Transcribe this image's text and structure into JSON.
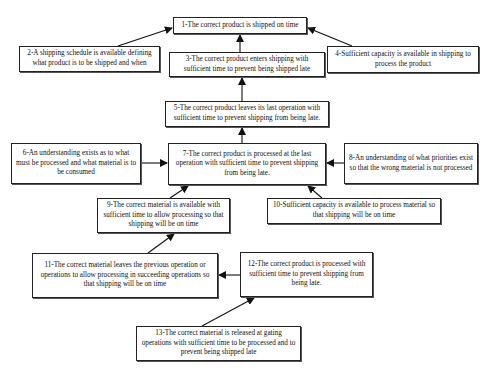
{
  "diagram": {
    "type": "prerequisite-tree",
    "nodes": [
      {
        "id": 1,
        "text": "1-The correct product is shipped on time",
        "box": [
          173,
          17,
          134,
          17
        ]
      },
      {
        "id": 2,
        "text": "2-A shipping schedule is available defining what product is to be shipped and when",
        "box": [
          19,
          46,
          141,
          26
        ]
      },
      {
        "id": 3,
        "text": "3-The correct product enters shipping with sufficient time to prevent being shipped late",
        "box": [
          169,
          52,
          156,
          25
        ]
      },
      {
        "id": 4,
        "text": "4-Sufficient capacity is available in shipping to process the product",
        "box": [
          327,
          46,
          152,
          27
        ]
      },
      {
        "id": 5,
        "text": "5-The correct product leaves its last operation with sufficient time to prevent shipping from being late.",
        "box": [
          165,
          101,
          164,
          26
        ]
      },
      {
        "id": 6,
        "text": "6-An understanding exists as to what must be processed and what material is to be consumed",
        "box": [
          11,
          143,
          130,
          41
        ]
      },
      {
        "id": 7,
        "text": "7-The correct product is processed at the last operation with sufficient time to prevent shipping from being late.",
        "box": [
          168,
          143,
          158,
          42
        ]
      },
      {
        "id": 8,
        "text": "8-An understanding of what priorities exist so that the wrong material is not processed",
        "box": [
          344,
          143,
          134,
          41
        ]
      },
      {
        "id": 9,
        "text": "9-The correct material is available with sufficient time to allow processing so that shipping will be on time",
        "box": [
          97,
          198,
          133,
          35
        ]
      },
      {
        "id": 10,
        "text": "10-Sufficient capacity is available to process material so that shipping will be on time",
        "box": [
          267,
          198,
          174,
          26
        ]
      },
      {
        "id": 11,
        "text": "11-The correct material leaves the previous operation or operations to allow processing in succeeding operations so that shipping will be on time",
        "box": [
          32,
          253,
          186,
          45
        ]
      },
      {
        "id": 12,
        "text": "12-The correct product is processed with sufficient time to prevent shipping from being late.",
        "box": [
          240,
          252,
          133,
          45
        ]
      },
      {
        "id": 13,
        "text": "13-The correct material is released at gating operations with sufficient time to be processed and to prevent being shipped late",
        "box": [
          136,
          326,
          165,
          35
        ]
      }
    ],
    "edges": [
      {
        "from": 2,
        "to": 1,
        "line": [
          118,
          46,
          172,
          28
        ]
      },
      {
        "from": 3,
        "to": 1,
        "line": [
          240,
          52,
          240,
          35
        ]
      },
      {
        "from": 4,
        "to": 1,
        "line": [
          352,
          46,
          308,
          28
        ]
      },
      {
        "from": 5,
        "to": 3,
        "line": [
          242,
          101,
          242,
          78
        ]
      },
      {
        "from": 7,
        "to": 5,
        "line": [
          242,
          143,
          242,
          128
        ]
      },
      {
        "from": 6,
        "to": 7,
        "line": [
          141,
          163,
          167,
          163
        ]
      },
      {
        "from": 8,
        "to": 7,
        "line": [
          344,
          163,
          327,
          163
        ]
      },
      {
        "from": 9,
        "to": 7,
        "line": [
          170,
          198,
          188,
          186
        ]
      },
      {
        "from": 10,
        "to": 7,
        "line": [
          322,
          198,
          308,
          186
        ]
      },
      {
        "from": 11,
        "to": 9,
        "line": [
          148,
          253,
          174,
          234
        ]
      },
      {
        "from": 12,
        "to": 11,
        "line": [
          240,
          275,
          219,
          275
        ]
      },
      {
        "from": 13,
        "to": 12,
        "line": [
          202,
          326,
          254,
          298
        ]
      }
    ]
  }
}
